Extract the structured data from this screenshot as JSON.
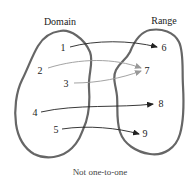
{
  "diagram": {
    "domain_label": "Domain",
    "range_label": "Range",
    "caption": "Not one-to-one",
    "domain_points": [
      {
        "label": "1"
      },
      {
        "label": "2"
      },
      {
        "label": "3"
      },
      {
        "label": "4"
      },
      {
        "label": "5"
      }
    ],
    "range_points": [
      {
        "label": "6"
      },
      {
        "label": "7"
      },
      {
        "label": "8"
      },
      {
        "label": "9"
      }
    ],
    "mappings": [
      {
        "from": "1",
        "to": "6"
      },
      {
        "from": "2",
        "to": "7"
      },
      {
        "from": "3",
        "to": "7"
      },
      {
        "from": "4",
        "to": "8"
      },
      {
        "from": "5",
        "to": "9"
      }
    ],
    "colors": {
      "blob_stroke": "#666666",
      "arrow_dark": "#222222",
      "arrow_light": "#999999"
    }
  }
}
